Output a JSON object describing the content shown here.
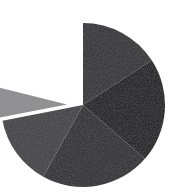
{
  "figure": {
    "name": "pie-chart-figure",
    "width": 183,
    "height": 192,
    "background": "#ffffff"
  },
  "chart_data": {
    "type": "pie",
    "title": "",
    "subtitle": "",
    "xlabel": "",
    "ylabel": "",
    "grid": false,
    "legend": false,
    "legend_position": "none",
    "labels_shown": false,
    "center_x": 83,
    "center_y": 105,
    "radius": 82,
    "start_angle_deg": -90,
    "direction": "clockwise",
    "gap_wedge_deg": 76,
    "categories": [
      "Slice A",
      "Slice B",
      "Slice C",
      "Slice D",
      "Slice E"
    ],
    "values": [
      14,
      21,
      22,
      14,
      8
    ],
    "angles_deg": [
      57,
      74,
      78,
      50,
      25
    ],
    "colors": [
      "#2f2f33",
      "#121216",
      "#2a2a2e",
      "#404044",
      "#8d8d91"
    ],
    "exploded": [
      false,
      false,
      false,
      false,
      true
    ],
    "explode_offset_px": 16,
    "slices": [
      {
        "name": "Slice A",
        "value": 14,
        "start_deg": -90,
        "end_deg": -33,
        "color": "#2f2f33",
        "exploded": false
      },
      {
        "name": "Slice B",
        "value": 21,
        "start_deg": -33,
        "end_deg": 41,
        "color": "#121216",
        "exploded": false
      },
      {
        "name": "Slice C",
        "value": 22,
        "start_deg": 41,
        "end_deg": 119,
        "color": "#2a2a2e",
        "exploded": false
      },
      {
        "name": "Slice D",
        "value": 14,
        "start_deg": 119,
        "end_deg": 169,
        "color": "#404044",
        "exploded": false
      },
      {
        "name": "Slice E",
        "value": 8,
        "start_deg": 169,
        "end_deg": 194,
        "color": "#8d8d91",
        "exploded": true
      }
    ],
    "texture": "subtle-noise"
  }
}
